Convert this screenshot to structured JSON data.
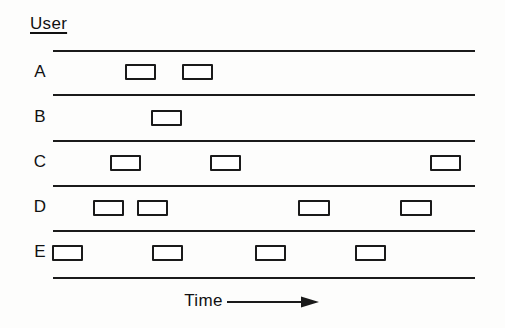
{
  "figure": {
    "title": "User",
    "axis_caption": "Time",
    "axis_arrow_icon": "arrow-right-icon",
    "line_color": "#1a1a1a",
    "background_color": "#ffffff"
  },
  "chart_data": {
    "type": "timeline",
    "title": "User",
    "xlabel": "Time",
    "ylabel": "User",
    "categories": [
      "A",
      "B",
      "C",
      "D",
      "E"
    ],
    "grid": false,
    "legend": null,
    "x_axis_has_ticks": false,
    "x_axis_arrow": true,
    "lane_left_px": 53,
    "lane_right_px": 475,
    "series": [
      {
        "name": "A",
        "bursts": [
          {
            "x": 125,
            "width": 31
          },
          {
            "x": 182,
            "width": 31
          }
        ]
      },
      {
        "name": "B",
        "bursts": [
          {
            "x": 151,
            "width": 31
          }
        ]
      },
      {
        "name": "C",
        "bursts": [
          {
            "x": 110,
            "width": 31
          },
          {
            "x": 210,
            "width": 31
          },
          {
            "x": 430,
            "width": 31
          }
        ]
      },
      {
        "name": "D",
        "bursts": [
          {
            "x": 93,
            "width": 31
          },
          {
            "x": 137,
            "width": 31
          },
          {
            "x": 298,
            "width": 32
          },
          {
            "x": 400,
            "width": 32
          }
        ]
      },
      {
        "name": "E",
        "bursts": [
          {
            "x": 52,
            "width": 31
          },
          {
            "x": 152,
            "width": 31
          },
          {
            "x": 255,
            "width": 31
          },
          {
            "x": 355,
            "width": 31
          }
        ]
      }
    ],
    "lane_rules_y": [
      50,
      94,
      140,
      185,
      230,
      277
    ],
    "lane_label_y": [
      72,
      117,
      162,
      207,
      252
    ],
    "burst_y": [
      64,
      110,
      155,
      200,
      245
    ],
    "burst_height": 16
  }
}
